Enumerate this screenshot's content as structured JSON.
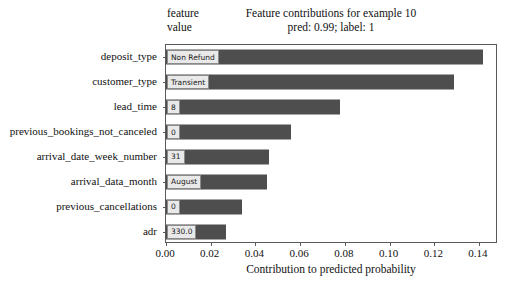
{
  "chart_data": {
    "type": "bar",
    "orientation": "horizontal",
    "title": "Feature contributions for example 10",
    "subtitle": "pred: 0.99; label: 1",
    "xlabel": "Contribution to predicted probability",
    "ylabel": "",
    "xlim": [
      0.0,
      0.1485
    ],
    "xticks": [
      0.0,
      0.02,
      0.04,
      0.06,
      0.08,
      0.1,
      0.12,
      0.14
    ],
    "xticklabels": [
      "0.00",
      "0.02",
      "0.04",
      "0.06",
      "0.08",
      "0.10",
      "0.12",
      "0.14"
    ],
    "grid": false,
    "legend": false,
    "bar_color": "#4e4e4e",
    "categories": [
      "deposit_type",
      "customer_type",
      "lead_time",
      "previous_bookings_not_canceled",
      "arrival_date_week_number",
      "arrival_data_month",
      "previous_cancellations",
      "adr"
    ],
    "values": [
      0.142,
      0.129,
      0.078,
      0.056,
      0.046,
      0.045,
      0.034,
      0.027
    ],
    "annotations": {
      "column_header": "feature\nvalue",
      "feature_values": [
        "Non Refund",
        "Transient",
        "8",
        "0",
        "31",
        "August",
        "0",
        "330.0"
      ]
    }
  },
  "header": {
    "col_line1": "feature",
    "col_line2": "value"
  },
  "titles": {
    "line1": "Feature contributions for example 10",
    "line2": "pred: 0.99; label: 1"
  },
  "axis": {
    "xlabel": "Contribution to predicted probability"
  }
}
